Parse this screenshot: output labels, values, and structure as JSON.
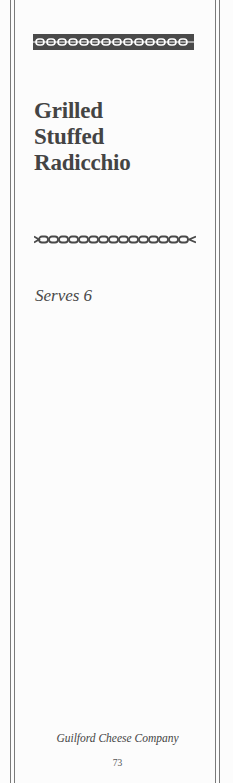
{
  "recipe": {
    "title_lines": [
      "Grilled",
      "Stuffed",
      "Radicchio"
    ],
    "serves": "Serves 6"
  },
  "footer": {
    "brand": "Guilford Cheese Company",
    "page_number": "73"
  },
  "colors": {
    "ink": "#444444",
    "rule": "#7a7a7a",
    "band": "#4a4a4a",
    "paper": "#fcfcfc"
  }
}
